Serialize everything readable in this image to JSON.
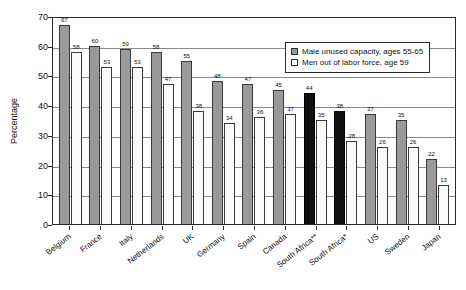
{
  "chart_data": {
    "type": "bar",
    "title": "",
    "xlabel": "",
    "ylabel": "Percentage",
    "ylim": [
      0,
      70
    ],
    "ytick_step": 10,
    "yticks": [
      "70",
      "60",
      "50",
      "40",
      "30",
      "20",
      "10",
      "0"
    ],
    "grid": true,
    "legend_position": "top-right-inside",
    "categories": [
      "Belgium",
      "France",
      "Italy",
      "Netherlands",
      "UK",
      "Germany",
      "Spain",
      "Canada",
      "South Africa**",
      "South Africa*",
      "US",
      "Sweden",
      "Japan"
    ],
    "series": [
      {
        "name": "Male unused capacity, ages 55-65",
        "color": "#9a9a9a",
        "values": [
          67,
          60,
          59,
          58,
          55,
          48,
          47,
          45,
          44,
          38,
          37,
          35,
          22
        ]
      },
      {
        "name": "Men out of labor force, age 59",
        "color": "#fafafa",
        "values": [
          58,
          53,
          53,
          47,
          38,
          34,
          36,
          37,
          35,
          28,
          26,
          26,
          13
        ]
      }
    ],
    "highlighted_categories": [
      "South Africa**",
      "South Africa*"
    ],
    "highlight_color": "#111111"
  },
  "legend": {
    "items": [
      {
        "label": "Male unused capacity, ages 55-65",
        "swatch": "series-dark"
      },
      {
        "label": "Men out of labor force, age 59",
        "swatch": "series-light"
      }
    ]
  }
}
